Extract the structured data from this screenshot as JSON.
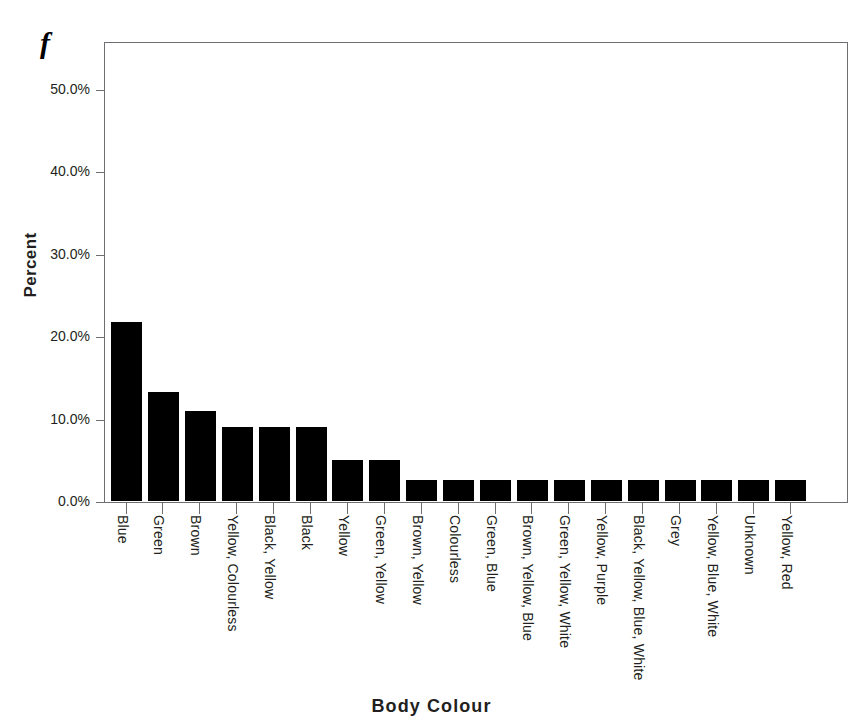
{
  "figure": {
    "panel_letter": "f"
  },
  "chart_data": {
    "type": "bar",
    "title": "",
    "subtitle": "",
    "xlabel": "Body Colour",
    "ylabel": "Percent",
    "ylim": [
      0,
      50
    ],
    "grid": false,
    "legend": "none",
    "y_tick_labels": [
      "0.0%",
      "10.0%",
      "20.0%",
      "30.0%",
      "40.0%",
      "50.0%"
    ],
    "y_tick_values": [
      0,
      10,
      20,
      30,
      40,
      50
    ],
    "value_suffix": "%",
    "categories": [
      "Blue",
      "Green",
      "Brown",
      "Yellow, Colourless",
      "Black, Yellow",
      "Black",
      "Yellow",
      "Green, Yellow",
      "Brown, Yellow",
      "Colourless",
      "Green, Blue",
      "Brown, Yellow, Blue",
      "Green, Yellow, White",
      "Yellow, Purple",
      "Black, Yellow, Blue, White",
      "Grey",
      "Yellow, Blue, White",
      "Unknown",
      "Yellow, Red"
    ],
    "values": [
      21.7,
      13.2,
      10.9,
      9.0,
      9.0,
      9.0,
      5.0,
      5.0,
      2.5,
      2.5,
      2.5,
      2.5,
      2.5,
      2.5,
      2.5,
      2.5,
      2.5,
      2.5,
      2.5
    ],
    "bar_color": "#000000",
    "axis_color": "#6d6e71",
    "text_color": "#231f20"
  }
}
